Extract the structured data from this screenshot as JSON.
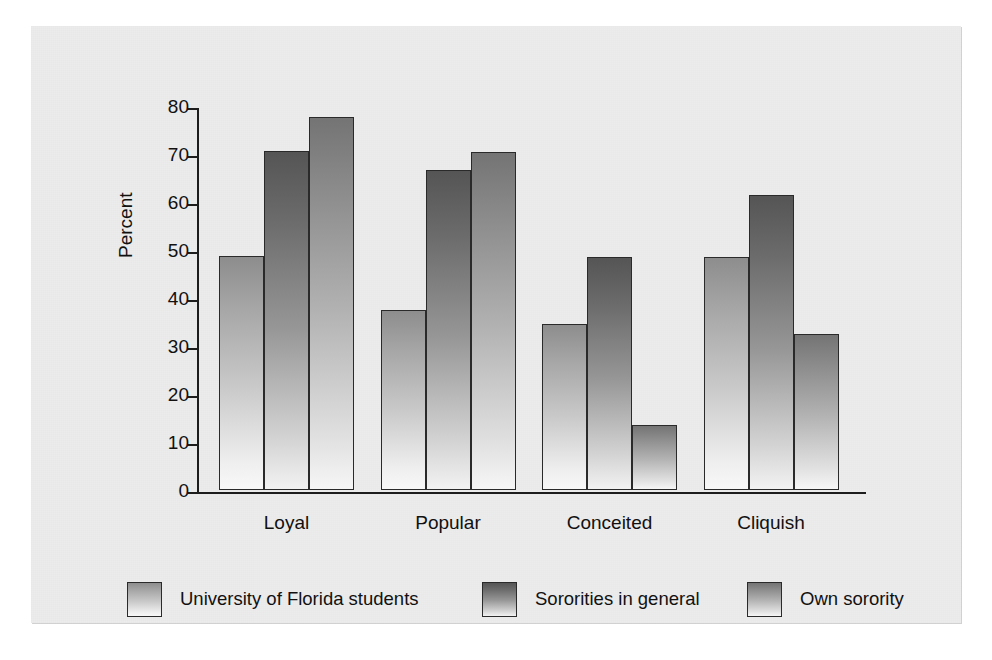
{
  "chart_data": {
    "type": "bar",
    "title": "",
    "subtitle": "",
    "xlabel": "",
    "ylabel": "Percent",
    "ylim": [
      0,
      80
    ],
    "yticks": [
      0,
      10,
      20,
      30,
      40,
      50,
      60,
      70,
      80
    ],
    "grid": false,
    "legend_position": "bottom",
    "categories": [
      "Loyal",
      "Popular",
      "Conceited",
      "Cliquish"
    ],
    "series": [
      {
        "name": "University of Florida students",
        "values": [
          48.7,
          37.4,
          34.6,
          48.5
        ],
        "color": "#b0b0b0"
      },
      {
        "name": "Sororities in general",
        "values": [
          70.7,
          66.6,
          48.5,
          61.4
        ],
        "color": "#6d6d6d"
      },
      {
        "name": "Own sorority",
        "values": [
          77.7,
          70.5,
          13.5,
          32.4
        ],
        "color": "#8f8f8f"
      }
    ]
  },
  "figure": {
    "panel_background": "#ececec",
    "page_background": "#ffffff",
    "axis_color": "#1d1d1d",
    "text_color": "#111111"
  }
}
